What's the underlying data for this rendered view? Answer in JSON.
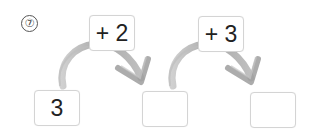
{
  "problem": {
    "number_label": "⑦",
    "start_value": "3",
    "steps": [
      {
        "operation": "+ 2",
        "result": ""
      },
      {
        "operation": "+ 3",
        "result": ""
      }
    ]
  },
  "colors": {
    "arrow": "#a9a9a9",
    "box_border": "#d4d4d4",
    "text": "#222222"
  }
}
